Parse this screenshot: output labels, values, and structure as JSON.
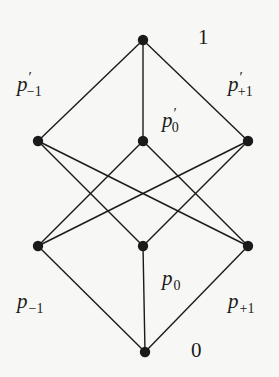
{
  "diagram": {
    "type": "hasse-lattice",
    "colors": {
      "background": "#f7f7f5",
      "ink": "#1a1a1a"
    },
    "nodes": [
      {
        "id": "top",
        "x": 143,
        "y": 40
      },
      {
        "id": "ml",
        "x": 38,
        "y": 141
      },
      {
        "id": "mc",
        "x": 143,
        "y": 141
      },
      {
        "id": "mr",
        "x": 248,
        "y": 141
      },
      {
        "id": "ll",
        "x": 38,
        "y": 246
      },
      {
        "id": "lc",
        "x": 143,
        "y": 246
      },
      {
        "id": "lr",
        "x": 248,
        "y": 246
      },
      {
        "id": "bot",
        "x": 145,
        "y": 352
      }
    ],
    "edges": [
      [
        "top",
        "ml"
      ],
      [
        "top",
        "mc"
      ],
      [
        "top",
        "mr"
      ],
      [
        "ml",
        "lc"
      ],
      [
        "ml",
        "lr"
      ],
      [
        "mc",
        "ll"
      ],
      [
        "mc",
        "lr"
      ],
      [
        "mr",
        "ll"
      ],
      [
        "mr",
        "lc"
      ],
      [
        "ll",
        "bot"
      ],
      [
        "lc",
        "bot"
      ],
      [
        "lr",
        "bot"
      ]
    ],
    "labels": {
      "top": {
        "text": "1"
      },
      "bottom": {
        "text": "0"
      },
      "p_prime_minus1": {
        "base": "p",
        "sup": "′",
        "sub": "−1"
      },
      "p_prime_0": {
        "base": "p",
        "sup": "′",
        "sub": "0"
      },
      "p_prime_plus1": {
        "base": "p",
        "sup": "′",
        "sub": "+1"
      },
      "p_minus1": {
        "base": "p",
        "sub": "−1"
      },
      "p_0": {
        "base": "p",
        "sub": "0"
      },
      "p_plus1": {
        "base": "p",
        "sub": "+1"
      }
    }
  }
}
